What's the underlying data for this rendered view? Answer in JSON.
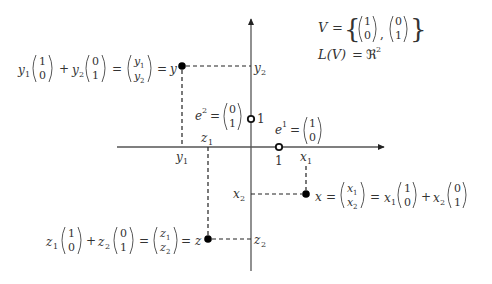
{
  "diagram": {
    "title_set": {
      "lhs": "V",
      "eq": "=",
      "vec1": [
        "1",
        "0"
      ],
      "sep": ",",
      "vec2": [
        "0",
        "1"
      ]
    },
    "span": {
      "lhs": "L(V)",
      "eq": "=",
      "rhs": "ℜ",
      "exp": "2"
    },
    "axes": {
      "origin": [
        251,
        147
      ],
      "x_range": [
        117,
        385
      ],
      "y_range": [
        18,
        271
      ]
    },
    "basis": {
      "e1": {
        "label": "e",
        "sup": "1",
        "eq": "=",
        "vec": [
          "1",
          "0"
        ],
        "tick": "1",
        "pos": [
          279,
          147
        ]
      },
      "e2": {
        "label": "e",
        "sup": "2",
        "eq": "=",
        "vec": [
          "0",
          "1"
        ],
        "tick": "1",
        "pos": [
          251,
          119
        ]
      }
    },
    "points": {
      "y": {
        "name": "y",
        "pos": [
          182,
          66
        ],
        "coord1": "y",
        "coord1_sub": "1",
        "coord2": "y",
        "coord2_sub": "2",
        "equation": "y₁(1,0) + y₂(0,1) = (y₁,y₂) = y"
      },
      "x": {
        "name": "x",
        "pos": [
          306,
          194
        ],
        "coord1": "x",
        "coord1_sub": "1",
        "coord2": "x",
        "coord2_sub": "2",
        "equation": "x = (x₁,x₂) = x₁(1,0) + x₂(0,1)"
      },
      "z": {
        "name": "z",
        "pos": [
          208,
          239
        ],
        "coord1": "z",
        "coord1_sub": "1",
        "coord2": "z",
        "coord2_sub": "2",
        "equation": "z₁(1,0) + z₂(0,1) = (z₁,z₂) = z"
      }
    },
    "symbols": {
      "plus": "+",
      "equals": "=",
      "zero": "0",
      "one": "1"
    }
  }
}
